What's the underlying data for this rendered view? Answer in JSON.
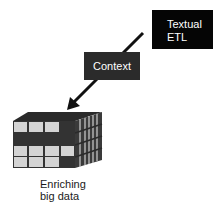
{
  "diagram": {
    "source_box": {
      "line1": "Textual",
      "line2": "ETL"
    },
    "middle_box": {
      "label": "Context"
    },
    "target": {
      "caption_line1": "Enriching",
      "caption_line2": "big data"
    },
    "colors": {
      "source_box": "#050505",
      "middle_box": "#2b2b2b",
      "cube_dark": "#333333",
      "cube_light": "#d4d4d4",
      "arrow": "#111111"
    }
  }
}
